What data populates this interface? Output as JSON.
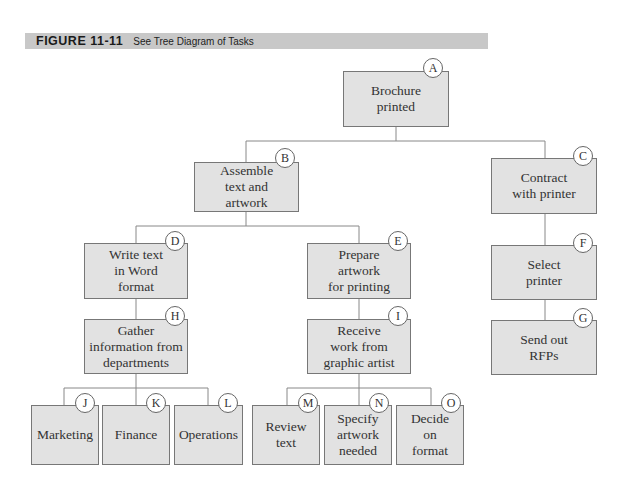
{
  "header": {
    "figure_number": "FIGURE 11-11",
    "caption": "See Tree Diagram of Tasks",
    "bar_color": "#c8c8c8"
  },
  "colors": {
    "node_fill": "#e2e2e2",
    "node_border": "#777777",
    "line": "#888888"
  },
  "nodes": {
    "A": {
      "id": "A",
      "label": "Brochure\nprinted"
    },
    "B": {
      "id": "B",
      "label": "Assemble\ntext and\nartwork"
    },
    "C": {
      "id": "C",
      "label": "Contract\nwith printer"
    },
    "D": {
      "id": "D",
      "label": "Write text\nin Word\nformat"
    },
    "E": {
      "id": "E",
      "label": "Prepare\nartwork\nfor printing"
    },
    "F": {
      "id": "F",
      "label": "Select\nprinter"
    },
    "G": {
      "id": "G",
      "label": "Send out\nRFPs"
    },
    "H": {
      "id": "H",
      "label": "Gather\ninformation from\ndepartments"
    },
    "I": {
      "id": "I",
      "label": "Receive\nwork from\ngraphic artist"
    },
    "J": {
      "id": "J",
      "label": "Marketing"
    },
    "K": {
      "id": "K",
      "label": "Finance"
    },
    "L": {
      "id": "L",
      "label": "Operations"
    },
    "M": {
      "id": "M",
      "label": "Review\ntext"
    },
    "N": {
      "id": "N",
      "label": "Specify\nartwork\nneeded"
    },
    "O": {
      "id": "O",
      "label": "Decide\non\nformat"
    }
  },
  "edges": [
    [
      "A",
      "B"
    ],
    [
      "A",
      "C"
    ],
    [
      "B",
      "D"
    ],
    [
      "B",
      "E"
    ],
    [
      "C",
      "F"
    ],
    [
      "F",
      "G"
    ],
    [
      "D",
      "H"
    ],
    [
      "E",
      "I"
    ],
    [
      "H",
      "J"
    ],
    [
      "H",
      "K"
    ],
    [
      "H",
      "L"
    ],
    [
      "I",
      "M"
    ],
    [
      "I",
      "N"
    ],
    [
      "I",
      "O"
    ]
  ]
}
